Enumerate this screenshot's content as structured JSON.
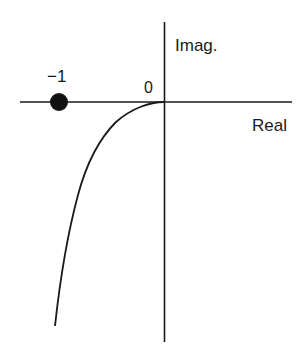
{
  "diagram": {
    "type": "nyquist-plot",
    "axes": {
      "imag_label": "Imag.",
      "real_label": "Real",
      "origin_label": "0"
    },
    "critical_point": {
      "label": "−1",
      "value": -1
    },
    "colors": {
      "stroke": "#1a1a1a",
      "background": "#ffffff"
    }
  }
}
